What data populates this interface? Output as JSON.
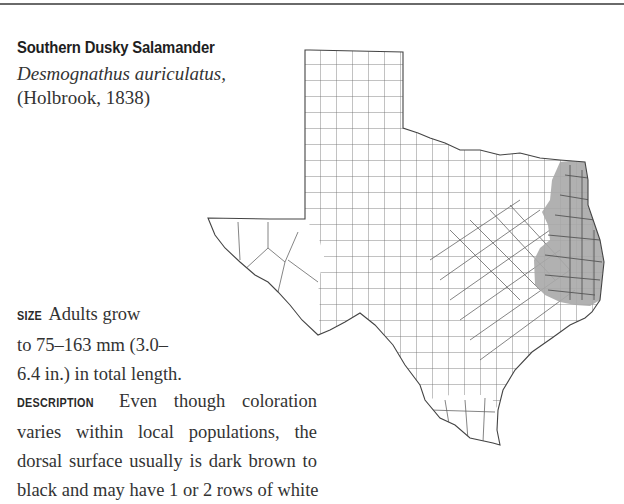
{
  "species": {
    "common_name": "Southern Dusky Salamander",
    "scientific_name": "Desmognathus auriculatus,",
    "authority": "(Holbrook, 1838)"
  },
  "size": {
    "label": "SIZE",
    "lines": [
      "Adults grow",
      "to 75–163 mm (3.0–",
      "6.4 in.) in total length."
    ]
  },
  "description": {
    "label": "DESCRIPTION",
    "lines": [
      "Even though coloration",
      "varies within local populations, the",
      "dorsal surface usually is dark brown to",
      "black and may have 1 or 2 rows of white"
    ]
  },
  "map": {
    "region": "Texas",
    "range_color": "#a9a9a9",
    "outline_color": "#555555"
  }
}
